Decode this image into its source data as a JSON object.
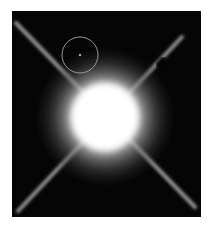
{
  "image": {
    "subject": "bright star with diffraction spikes",
    "background_color": "#ffffff",
    "frame_color": "#050505",
    "glow_color": "#ffffff",
    "circle_marker": {
      "cx": 68,
      "cy": 44,
      "r": 18
    }
  }
}
